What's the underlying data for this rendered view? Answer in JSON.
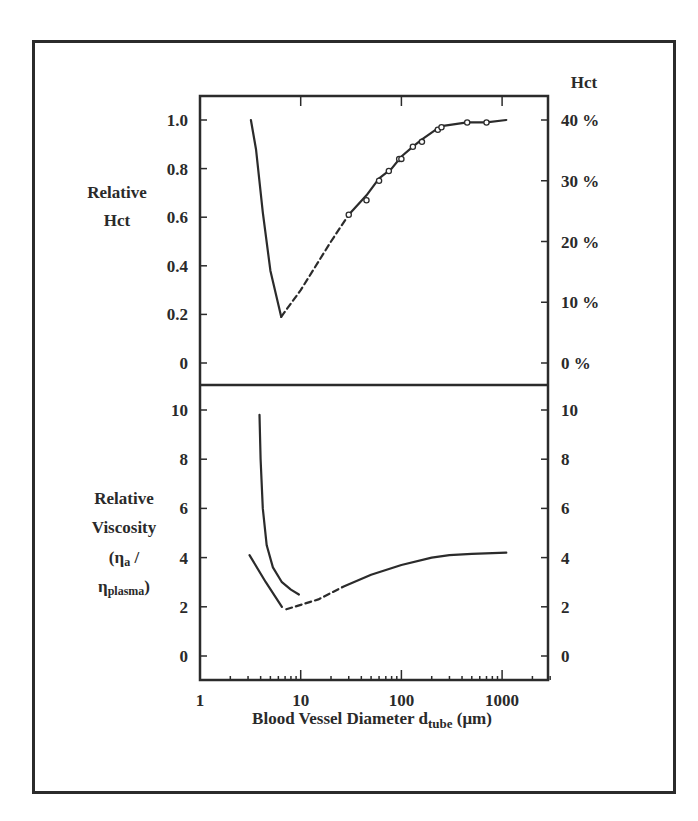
{
  "chart_data": [
    {
      "type": "line",
      "panel": "top",
      "title": "",
      "xlabel": "Blood Vessel Diameter d_tube (μm)",
      "xscale": "log",
      "xlim": [
        1,
        3000
      ],
      "x_ticks": [
        "1",
        "10",
        "100",
        "1000"
      ],
      "ylabel": "Relative Hct",
      "ylim": [
        -0.1,
        1.1
      ],
      "y_ticks": [
        "0",
        "0.2",
        "0.4",
        "0.6",
        "0.8",
        "1.0"
      ],
      "y2label": "Hct",
      "y2_ticks": [
        "0 %",
        "10 %",
        "20 %",
        "30 %",
        "40 %"
      ],
      "series": [
        {
          "name": "descending branch (solid)",
          "style": "solid",
          "x": [
            3.2,
            3.6,
            4.2,
            5.0,
            6.4
          ],
          "y": [
            1.0,
            0.88,
            0.62,
            0.38,
            0.19
          ]
        },
        {
          "name": "extrapolation (dashed)",
          "style": "dashed",
          "x": [
            6.4,
            10,
            20,
            30
          ],
          "y": [
            0.19,
            0.3,
            0.5,
            0.61
          ]
        },
        {
          "name": "measured fit (solid)",
          "style": "solid",
          "x": [
            30,
            45,
            60,
            80,
            100,
            130,
            160,
            220,
            250,
            450,
            700,
            1100
          ],
          "y": [
            0.61,
            0.69,
            0.76,
            0.8,
            0.85,
            0.89,
            0.92,
            0.96,
            0.975,
            0.99,
            0.99,
            1.0
          ]
        },
        {
          "name": "data points",
          "style": "markers",
          "x": [
            30,
            45,
            60,
            75,
            95,
            100,
            130,
            160,
            230,
            250,
            450,
            700
          ],
          "y": [
            0.61,
            0.67,
            0.75,
            0.79,
            0.84,
            0.84,
            0.89,
            0.91,
            0.96,
            0.97,
            0.99,
            0.99
          ]
        }
      ]
    },
    {
      "type": "line",
      "panel": "bottom",
      "title": "",
      "xlabel": "Blood Vessel Diameter d_tube (μm)",
      "xscale": "log",
      "xlim": [
        1,
        3000
      ],
      "x_ticks": [
        "1",
        "10",
        "100",
        "1000"
      ],
      "ylabel": "Relative Viscosity (ηa / ηplasma)",
      "ylim": [
        -1,
        11
      ],
      "y_ticks": [
        "0",
        "2",
        "4",
        "6",
        "8",
        "10"
      ],
      "y2_ticks": [
        "0",
        "2",
        "4",
        "6",
        "8",
        "10"
      ],
      "series": [
        {
          "name": "upper branch",
          "style": "solid",
          "x": [
            3.9,
            4.0,
            4.2,
            4.6,
            5.3,
            6.5,
            8.0,
            9.6
          ],
          "y": [
            9.8,
            8.0,
            6.0,
            4.5,
            3.6,
            3.0,
            2.7,
            2.5
          ]
        },
        {
          "name": "lower branch",
          "style": "solid",
          "x": [
            3.1,
            4.5,
            6.5
          ],
          "y": [
            4.1,
            3.0,
            2.0
          ]
        },
        {
          "name": "extrapolation (dashed)",
          "style": "dashed",
          "x": [
            7.2,
            15,
            26
          ],
          "y": [
            1.9,
            2.3,
            2.8
          ]
        },
        {
          "name": "large vessel branch",
          "style": "solid",
          "x": [
            26,
            50,
            100,
            200,
            300,
            500,
            1100
          ],
          "y": [
            2.8,
            3.3,
            3.7,
            4.0,
            4.1,
            4.15,
            4.2
          ]
        }
      ]
    }
  ],
  "labels": {
    "top_ylabel_line1": "Relative",
    "top_ylabel_line2": "Hct",
    "top_y2label": "Hct",
    "bottom_ylabel_line1": "Relative",
    "bottom_ylabel_line2": "Viscosity",
    "bottom_ylabel_eta_a": "(η",
    "bottom_ylabel_a_sub": "a",
    "bottom_ylabel_slash": " /",
    "bottom_ylabel_eta_p": "η",
    "bottom_ylabel_p_sub": "plasma",
    "bottom_ylabel_paren": ")",
    "xlabel_main": "Blood Vessel Diameter d",
    "xlabel_sub": "tube",
    "xlabel_unit": " (μm)"
  }
}
